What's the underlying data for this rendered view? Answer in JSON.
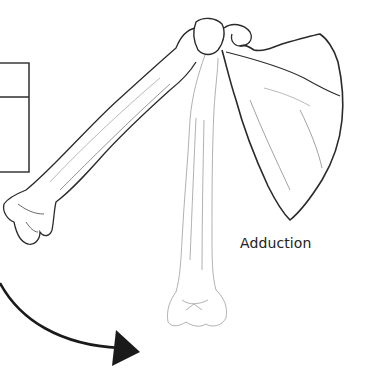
{
  "diagram": {
    "label": "Adduction",
    "elements": {
      "partial_box": "partial rectangular box (cropped at left edge)",
      "humerus_abducted": "humerus raised (dark outline)",
      "humerus_adducted": "humerus lowered alongside body (light outline)",
      "scapula": "scapula with acromion and coracoid",
      "arrow": "curved arrow pointing downward-right indicating adduction motion"
    },
    "colors": {
      "stroke_dark": "#2a2a2a",
      "stroke_light": "#9a9a9a",
      "arrow": "#1a1a1a",
      "text": "#222222",
      "background": "#ffffff"
    }
  }
}
